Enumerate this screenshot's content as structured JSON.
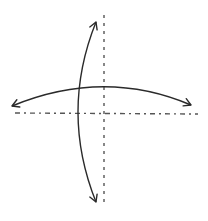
{
  "diagram": {
    "colors": {
      "background": "#ffffff",
      "stroke": "#2a2a2a",
      "axis": "#555555"
    },
    "axes": [
      {
        "name": "vertical-axis",
        "style": "dashed",
        "x1": 104,
        "y1": 15,
        "x2": 104,
        "y2": 207
      },
      {
        "name": "horizontal-axis",
        "style": "dash-dot",
        "x1": 15,
        "y1": 113,
        "x2": 198,
        "y2": 114
      }
    ],
    "arrows": [
      {
        "name": "vertical-curved-arrow",
        "heads": "both",
        "path": "M96 22 Q 60 112 96 202"
      },
      {
        "name": "horizontal-curved-arrow",
        "heads": "both",
        "path": "M12 106 Q 104 68 191 105"
      }
    ]
  }
}
